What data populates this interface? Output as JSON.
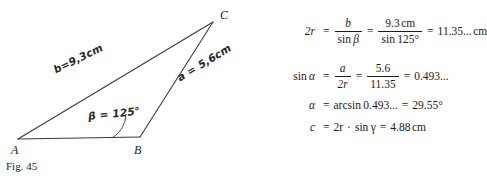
{
  "figure": {
    "caption": "Fig. 45",
    "vertices": [
      {
        "name": "A",
        "label": "A",
        "x": 18,
        "y": 139
      },
      {
        "name": "B",
        "label": "B",
        "x": 140,
        "y": 137
      },
      {
        "name": "C",
        "label": "C",
        "x": 213,
        "y": 22
      }
    ],
    "annotations": {
      "side_b": "b=9,3cm",
      "side_a": "a = 5,6cm",
      "angle_beta": "β = 125°"
    },
    "stroke_color": "#3a3a3a"
  },
  "equations": {
    "line1": {
      "lhs_var": "2r",
      "eq1": "=",
      "frac1_num": "b",
      "frac1_den_fn": "sin",
      "frac1_den_var": "β",
      "eq2": "=",
      "frac2_num": "9.3",
      "frac2_num_unit": "cm",
      "frac2_den_fn": "sin",
      "frac2_den_val": "125°",
      "eq3": "=",
      "result": "11.35...",
      "result_unit": "cm"
    },
    "line2": {
      "lhs_fn": "sin",
      "lhs_var": "α",
      "eq1": "=",
      "frac1_num": "a",
      "frac1_den": "2r",
      "eq2": "=",
      "frac2_num": "5.6",
      "frac2_den": "11.35",
      "eq3": "=",
      "result": "0.493..."
    },
    "line3": {
      "lhs_var": "α",
      "eq1": "=",
      "fn": "arcsin",
      "arg": "0.493...",
      "eq2": "=",
      "result": "29.55°"
    },
    "line4": {
      "lhs_var": "c",
      "eq1": "=",
      "term1": "2r",
      "dot": "·",
      "fn": "sin",
      "fn_var": "γ",
      "eq2": "=",
      "result": "4.88",
      "result_unit": "cm"
    }
  }
}
